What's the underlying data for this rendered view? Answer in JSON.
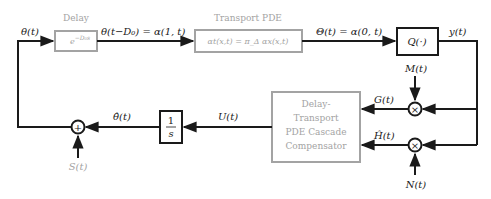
{
  "colors": {
    "active": "#1a1a1a",
    "inactive": "#a3a3a3",
    "background": "#ffffff"
  },
  "blocks": {
    "delay": {
      "title": "Delay",
      "content": "e^{-D0 s}",
      "content_main": "e",
      "content_sup": "−D₀s"
    },
    "transport": {
      "title": "Transport PDE",
      "content": "αt(x,t) = π_Δ αx(x,t)"
    },
    "quantizer": {
      "content": "Q(·)"
    },
    "integrator": {
      "numerator": "1",
      "denominator": "s"
    },
    "compensator": {
      "lines": [
        "Delay-",
        "Transport",
        "PDE Cascade",
        "Compensator"
      ]
    }
  },
  "junctions": {
    "sum": {
      "symbol": "+"
    },
    "mult_top": {
      "symbol": "×"
    },
    "mult_bottom": {
      "symbol": "×"
    }
  },
  "signals": {
    "theta": "θ(t)",
    "theta_delayed": "θ(t−D₀) = α(1, t)",
    "Theta": "Θ(t) = α(0, t)",
    "y": "y(t)",
    "M": "M(t)",
    "N": "N(t)",
    "G": "G(t)",
    "H_hat": "Ĥ(t)",
    "U": "U(t)",
    "theta_hat": "θ̂(t)",
    "S": "S(t)"
  }
}
